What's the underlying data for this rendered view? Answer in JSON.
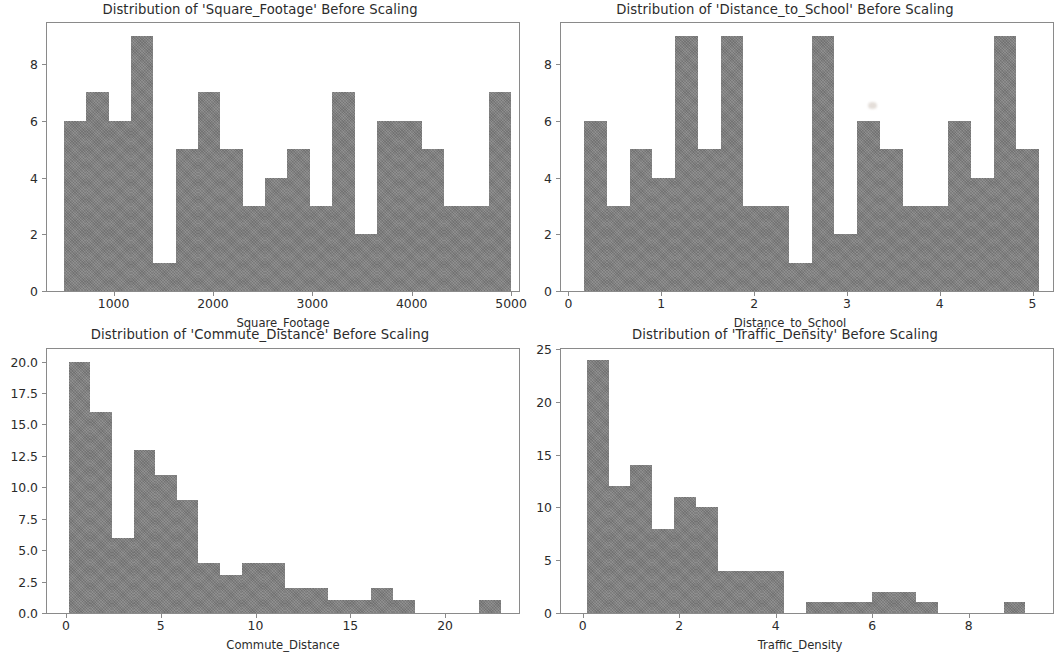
{
  "figure": {
    "background_color": "#ffffff",
    "bar_color": "#808080",
    "axis_color": "#8a8a8a",
    "text_color": "#2b2b2b"
  },
  "chart_data": [
    {
      "id": "square-footage",
      "type": "bar",
      "title": "Distribution of 'Square_Footage' Before Scaling",
      "xlabel": "Square_Footage",
      "ylabel": "",
      "xlim": [
        330,
        5080
      ],
      "ylim": [
        0,
        9.45
      ],
      "xticks": [
        1000,
        2000,
        3000,
        4000,
        5000
      ],
      "xtick_labels": [
        "1000",
        "2000",
        "3000",
        "4000",
        "5000"
      ],
      "yticks": [
        0,
        2,
        4,
        6,
        8
      ],
      "ytick_labels": [
        "0",
        "2",
        "4",
        "6",
        "8"
      ],
      "grid": false,
      "legend": "none",
      "bin_edges": [
        500,
        725,
        950,
        1175,
        1400,
        1625,
        1850,
        2075,
        2300,
        2525,
        2750,
        2975,
        3200,
        3425,
        3650,
        3875,
        4100,
        4325,
        4550,
        4775,
        5000
      ],
      "values": [
        6,
        7,
        6,
        9,
        1,
        5,
        7,
        5,
        3,
        4,
        5,
        3,
        7,
        2,
        6,
        6,
        5,
        3,
        3,
        7
      ]
    },
    {
      "id": "distance-to-school",
      "type": "bar",
      "title": "Distribution of 'Distance_to_School' Before Scaling",
      "xlabel": "Distance_to_School",
      "ylabel": "",
      "xlim": [
        -0.08,
        5.22
      ],
      "ylim": [
        0,
        9.45
      ],
      "xticks": [
        0,
        1,
        2,
        3,
        4,
        5
      ],
      "xtick_labels": [
        "0",
        "1",
        "2",
        "3",
        "4",
        "5"
      ],
      "yticks": [
        0,
        2,
        4,
        6,
        8
      ],
      "ytick_labels": [
        "0",
        "2",
        "4",
        "6",
        "8"
      ],
      "grid": false,
      "legend": "none",
      "bin_edges": [
        0.17,
        0.415,
        0.66,
        0.905,
        1.15,
        1.395,
        1.64,
        1.885,
        2.13,
        2.375,
        2.62,
        2.865,
        3.11,
        3.355,
        3.6,
        3.845,
        4.09,
        4.335,
        4.58,
        4.825,
        5.07
      ],
      "values": [
        6,
        3,
        5,
        4,
        9,
        5,
        9,
        3,
        3,
        1,
        9,
        2,
        6,
        5,
        3,
        3,
        6,
        4,
        9,
        5
      ]
    },
    {
      "id": "commute-distance",
      "type": "bar",
      "title": "Distribution of 'Commute_Distance' Before Scaling",
      "xlabel": "Commute_Distance",
      "ylabel": "",
      "xlim": [
        -1.0,
        23.9
      ],
      "ylim": [
        0,
        21.0
      ],
      "xticks": [
        0,
        5,
        10,
        15,
        20
      ],
      "xtick_labels": [
        "0",
        "5",
        "10",
        "15",
        "20"
      ],
      "yticks": [
        0.0,
        2.5,
        5.0,
        7.5,
        10.0,
        12.5,
        15.0,
        17.5,
        20.0
      ],
      "ytick_labels": [
        "0.0",
        "2.5",
        "5.0",
        "7.5",
        "10.0",
        "12.5",
        "15.0",
        "17.5",
        "20.0"
      ],
      "grid": false,
      "legend": "none",
      "bin_edges": [
        0.15,
        1.29,
        2.43,
        3.57,
        4.71,
        5.85,
        6.99,
        8.13,
        9.27,
        10.41,
        11.55,
        12.69,
        13.83,
        14.97,
        16.11,
        17.25,
        18.39,
        19.53,
        20.67,
        21.81,
        22.95
      ],
      "values": [
        20,
        16,
        6,
        13,
        11,
        9,
        4,
        3,
        4,
        4,
        2,
        2,
        1,
        1,
        2,
        1,
        0,
        0,
        0,
        1
      ]
    },
    {
      "id": "traffic-density",
      "type": "bar",
      "title": "Distribution of 'Traffic_Density' Before Scaling",
      "xlabel": "Traffic_Density",
      "ylabel": "",
      "xlim": [
        -0.45,
        9.75
      ],
      "ylim": [
        0,
        25.0
      ],
      "xticks": [
        0,
        2,
        4,
        6,
        8
      ],
      "xtick_labels": [
        "0",
        "2",
        "4",
        "6",
        "8"
      ],
      "yticks": [
        0,
        5,
        10,
        15,
        20,
        25
      ],
      "ytick_labels": [
        "0",
        "5",
        "10",
        "15",
        "20",
        "25"
      ],
      "grid": false,
      "legend": "none",
      "bin_edges": [
        0.08,
        0.535,
        0.99,
        1.445,
        1.9,
        2.355,
        2.81,
        3.265,
        3.72,
        4.175,
        4.63,
        5.085,
        5.54,
        5.995,
        6.45,
        6.905,
        7.36,
        7.815,
        8.27,
        8.725,
        9.18
      ],
      "values": [
        24,
        12,
        14,
        8,
        11,
        10,
        4,
        4,
        4,
        0,
        1,
        1,
        1,
        2,
        2,
        1,
        0,
        0,
        0,
        1
      ]
    }
  ]
}
